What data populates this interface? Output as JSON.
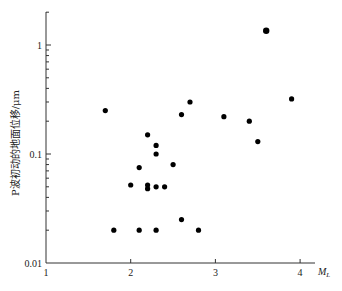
{
  "chart_data": {
    "type": "scatter",
    "title": "",
    "xlabel": "M_L",
    "xlabel_main": "M",
    "xlabel_sub": "L",
    "ylabel": "P波初动的地面位移/μm",
    "xlim": [
      1,
      4.2
    ],
    "ylim": [
      0.01,
      2
    ],
    "yscale": "log",
    "xscale": "linear",
    "grid": false,
    "legend": null,
    "x_ticks": [
      1,
      2,
      3,
      4
    ],
    "x_tick_labels": [
      "1",
      "2",
      "3",
      "4"
    ],
    "y_ticks": [
      0.01,
      0.1,
      1
    ],
    "y_tick_labels": [
      "0.01",
      "0.1",
      "1"
    ],
    "series": [
      {
        "name": "observations",
        "marker": "filled-circle",
        "color": "#000000",
        "points": [
          {
            "x": 1.7,
            "y": 0.25
          },
          {
            "x": 1.8,
            "y": 0.02
          },
          {
            "x": 2.0,
            "y": 0.052
          },
          {
            "x": 2.1,
            "y": 0.075
          },
          {
            "x": 2.1,
            "y": 0.02
          },
          {
            "x": 2.2,
            "y": 0.15
          },
          {
            "x": 2.2,
            "y": 0.052
          },
          {
            "x": 2.2,
            "y": 0.048
          },
          {
            "x": 2.3,
            "y": 0.12
          },
          {
            "x": 2.3,
            "y": 0.1
          },
          {
            "x": 2.3,
            "y": 0.05
          },
          {
            "x": 2.3,
            "y": 0.02
          },
          {
            "x": 2.4,
            "y": 0.05
          },
          {
            "x": 2.5,
            "y": 0.08
          },
          {
            "x": 2.6,
            "y": 0.23
          },
          {
            "x": 2.6,
            "y": 0.025
          },
          {
            "x": 2.7,
            "y": 0.3
          },
          {
            "x": 2.8,
            "y": 0.02
          },
          {
            "x": 3.1,
            "y": 0.22
          },
          {
            "x": 3.4,
            "y": 0.2
          },
          {
            "x": 3.5,
            "y": 0.13
          },
          {
            "x": 3.6,
            "y": 1.35
          },
          {
            "x": 3.9,
            "y": 0.32
          }
        ]
      }
    ]
  },
  "layout": {
    "origin_px": [
      46,
      263
    ],
    "x_px_per_unit": 84.7,
    "y_px_per_decade": 109,
    "x_axis_end_px": 315,
    "y_axis_top_px": 12
  }
}
